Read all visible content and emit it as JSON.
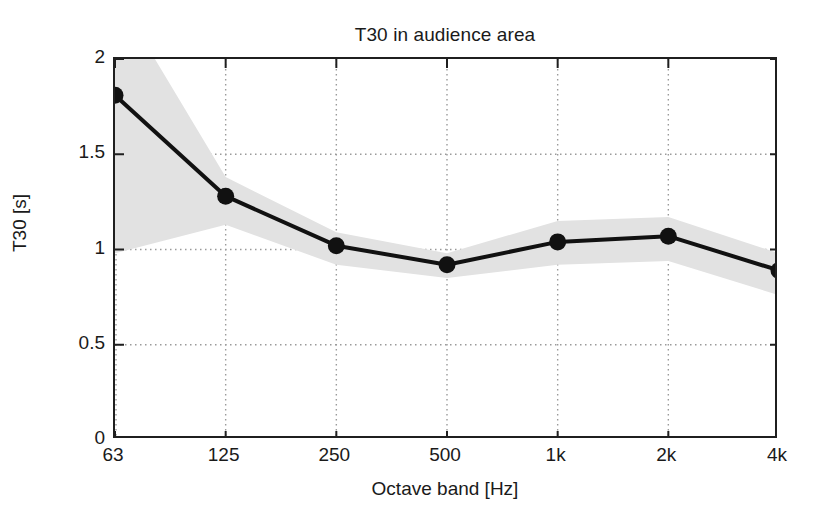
{
  "chart_data": {
    "type": "line",
    "title": "T30 in audience area",
    "xlabel": "Octave band [Hz]",
    "ylabel": "T30 [s]",
    "categories": [
      "63",
      "125",
      "250",
      "500",
      "1k",
      "2k",
      "4k"
    ],
    "values": [
      1.81,
      1.28,
      1.02,
      0.92,
      1.04,
      1.07,
      0.89
    ],
    "band_upper": [
      2.35,
      1.38,
      1.09,
      0.98,
      1.15,
      1.17,
      0.98
    ],
    "band_lower": [
      0.98,
      1.13,
      0.92,
      0.85,
      0.92,
      0.94,
      0.76
    ],
    "band_label": "standard deviation range",
    "ylim": [
      0,
      2
    ],
    "yticks": [
      0,
      0.5,
      1,
      1.5,
      2
    ],
    "ytick_labels": [
      "0",
      "0.5",
      "1",
      "1.5",
      "2"
    ],
    "grid": true,
    "grid_style": "dotted",
    "legend": "none",
    "series": [
      {
        "name": "T30 mean",
        "values": [
          1.81,
          1.28,
          1.02,
          0.92,
          1.04,
          1.07,
          0.89
        ],
        "marker": "filled-circle",
        "color": "#111111"
      }
    ],
    "colors": {
      "line": "#111111",
      "marker": "#111111",
      "band": "#e2e2e2",
      "grid": "#9a9a9a",
      "axis": "#1f1f1f",
      "background": "#ffffff"
    }
  }
}
